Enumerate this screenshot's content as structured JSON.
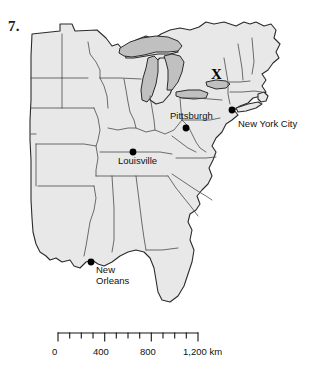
{
  "figure": {
    "question_number": "7.",
    "type": "reference-map",
    "region": "Eastern United States"
  },
  "map": {
    "x_marker": {
      "label": "X",
      "description": "marked location in New York State",
      "x": 216,
      "y": 76
    },
    "cities": [
      {
        "name": "Pittsburgh",
        "dot_x": 186,
        "dot_y": 128,
        "label_x": 170,
        "label_y": 110
      },
      {
        "name": "New York City",
        "dot_x": 232,
        "dot_y": 110,
        "label_x": 238,
        "label_y": 118
      },
      {
        "name": "Louisville",
        "dot_x": 133,
        "dot_y": 152,
        "label_x": 118,
        "label_y": 155
      },
      {
        "name": "New Orleans",
        "dot_x": 91,
        "dot_y": 262,
        "label_x": 96,
        "label_y": 264
      }
    ],
    "colors": {
      "land_fill": "#e8e8e8",
      "lake_fill": "#c0c0c0",
      "outline": "#2b2b2b",
      "state_border": "#4a4a4a",
      "background": "#ffffff",
      "text": "#101010"
    }
  },
  "scale_bar": {
    "unit": "km",
    "unit_label": "km",
    "ticks": [
      "0",
      "400",
      "800",
      "1,200"
    ],
    "tick_values": [
      0,
      400,
      800,
      1200
    ],
    "minor_tick_interval": 100,
    "max_value": 1200,
    "pixel_length": 140
  }
}
